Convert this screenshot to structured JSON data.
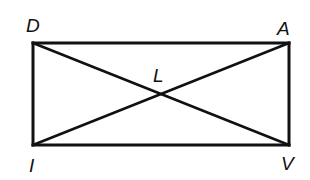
{
  "diagram": {
    "type": "rectangle-with-diagonals",
    "stroke_color": "#111111",
    "background_color": "#ffffff",
    "vertices": {
      "D": {
        "label": "D",
        "x": 33,
        "y": 43
      },
      "A": {
        "label": "A",
        "x": 289,
        "y": 43
      },
      "V": {
        "label": "V",
        "x": 289,
        "y": 145
      },
      "I": {
        "label": "I",
        "x": 33,
        "y": 145
      }
    },
    "intersection": {
      "label": "L",
      "x": 161,
      "y": 94
    },
    "segments": [
      {
        "name": "DA",
        "from": "D",
        "to": "A"
      },
      {
        "name": "AV",
        "from": "A",
        "to": "V"
      },
      {
        "name": "VI",
        "from": "V",
        "to": "I"
      },
      {
        "name": "ID",
        "from": "I",
        "to": "D"
      },
      {
        "name": "DV",
        "from": "D",
        "to": "V"
      },
      {
        "name": "IA",
        "from": "I",
        "to": "A"
      }
    ]
  }
}
